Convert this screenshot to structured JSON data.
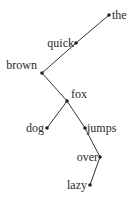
{
  "diagram": {
    "type": "dependency-tree",
    "nodes": [
      {
        "id": "the",
        "label": "the",
        "x": 109,
        "y": 15,
        "label_side": "right"
      },
      {
        "id": "quick",
        "label": "quick",
        "x": 76,
        "y": 43,
        "label_side": "left"
      },
      {
        "id": "brown",
        "label": "brown",
        "x": 42,
        "y": 73,
        "label_side": "left-above"
      },
      {
        "id": "fox",
        "label": "fox",
        "x": 67,
        "y": 101,
        "label_side": "right-above"
      },
      {
        "id": "dog",
        "label": "dog",
        "x": 47,
        "y": 128,
        "label_side": "left"
      },
      {
        "id": "jumps",
        "label": "jumps",
        "x": 85,
        "y": 128,
        "label_side": "right"
      },
      {
        "id": "over",
        "label": "over",
        "x": 100,
        "y": 157,
        "label_side": "left"
      },
      {
        "id": "lazy",
        "label": "lazy",
        "x": 90,
        "y": 185,
        "label_side": "left"
      }
    ],
    "edges": [
      {
        "from": "the",
        "to": "quick"
      },
      {
        "from": "quick",
        "to": "brown"
      },
      {
        "from": "brown",
        "to": "fox"
      },
      {
        "from": "fox",
        "to": "dog"
      },
      {
        "from": "fox",
        "to": "jumps"
      },
      {
        "from": "jumps",
        "to": "over"
      },
      {
        "from": "over",
        "to": "lazy"
      }
    ],
    "colors": {
      "edge": "#333333",
      "node": "#222222",
      "text": "#2a2a2a",
      "background": "#ffffff"
    }
  }
}
